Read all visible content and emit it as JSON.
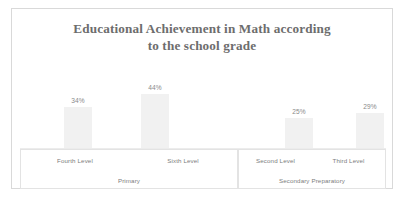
{
  "title": {
    "line1": "Educational Achievement in Math according",
    "line2": "to the school grade"
  },
  "groups": [
    {
      "name": "Primary",
      "categories": [
        "Fourth Level",
        "Sixth Level"
      ],
      "values": [
        "34%",
        "44%"
      ]
    },
    {
      "name": "Secondary Preparatory",
      "categories": [
        "Second Level",
        "Third Level"
      ],
      "values": [
        "25%",
        "29%"
      ]
    }
  ],
  "colors": {
    "bar_fill": "#f1f1f1",
    "title_text": "#6d6d6d",
    "label_text": "#7d7d7d",
    "panel_border": "#d9d9d9",
    "table_border": "#e3e3e3",
    "axis_line": "#ececec",
    "background": "#ffffff"
  },
  "chart_data": {
    "type": "bar",
    "title": "Educational Achievement in Math according to the school grade",
    "xlabel": "",
    "ylabel": "",
    "categories": [
      "Fourth Level",
      "Sixth Level",
      "Second Level",
      "Third Level"
    ],
    "group_labels": [
      "Primary",
      "Primary",
      "Secondary Preparatory",
      "Secondary Preparatory"
    ],
    "values": [
      34,
      44,
      25,
      29
    ],
    "data_labels": [
      "34%",
      "44%",
      "25%",
      "29%"
    ],
    "ylim": [
      0,
      100
    ],
    "grid": false,
    "legend": "none",
    "unit": "percent",
    "series": [
      {
        "name": "Achievement",
        "values": [
          34,
          44,
          25,
          29
        ]
      }
    ]
  }
}
